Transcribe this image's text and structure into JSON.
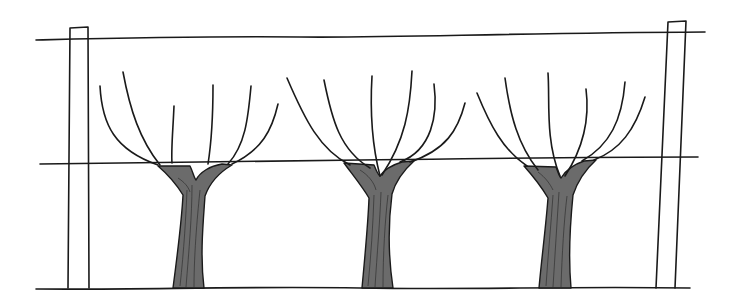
{
  "illustration": {
    "title": "Vines trained on a trellis",
    "colors": {
      "ink": "#1a1a1a",
      "trunk_fill": "#6b6b6b",
      "background": "#ffffff"
    },
    "wires": [
      {
        "name": "top-wire",
        "d": "M36,40 C120,38 200,36 300,37 S500,33 705,32"
      },
      {
        "name": "middle-wire",
        "d": "M40,164 C150,163 250,161 360,160 S560,157 698,157"
      },
      {
        "name": "ground-line",
        "d": "M36,289 C140,290 240,286 360,288 S560,286 690,288"
      }
    ],
    "posts": [
      {
        "name": "left-post",
        "d": "M68,288 L70,28 L88,27 L89,288"
      },
      {
        "name": "right-post",
        "d": "M656,288 L668,22 L686,21 L675,288"
      }
    ],
    "vines": [
      {
        "name": "vine-left",
        "trunk": "M173,288 C178,250 182,215 183,195 C175,182 165,172 158,166 L190,166 C193,172 194,178 196,180 C200,172 210,166 222,164 L232,165 C220,172 210,182 205,196 C203,225 200,255 204,288 Z",
        "grain": [
          "M180,286 C184,250 186,215 187,190",
          "M186,287 C189,250 192,215 192,185",
          "M194,287 C194,250 198,210 200,190",
          "M178,178 C184,182 188,186 190,192"
        ],
        "canes": [
          "M100,86 C102,125 115,150 158,165",
          "M123,72 C130,110 140,140 160,165",
          "M174,106 C173,130 171,150 172,163",
          "M213,85 C213,120 211,145 208,164",
          "M251,86 C248,120 245,145 228,164",
          "M278,104 C272,130 262,150 232,164"
        ]
      },
      {
        "name": "vine-middle",
        "trunk": "M362,288 C365,255 368,225 369,198 C362,186 352,174 344,163 L374,165 C376,170 378,175 380,176 C384,170 392,165 402,162 L414,161 C404,170 396,180 392,194 C388,225 388,255 393,288 Z",
        "grain": [
          "M368,286 C371,255 373,225 374,195",
          "M375,287 C377,255 380,220 381,192",
          "M383,287 C383,255 385,220 388,195",
          "M360,170 C368,175 374,182 376,190"
        ],
        "canes": [
          "M287,78 C305,120 320,150 350,165",
          "M324,80 C332,120 340,150 370,168",
          "M372,76 C370,110 372,145 380,176",
          "M412,71 C410,110 405,140 382,175",
          "M434,84 C438,115 432,150 400,162",
          "M465,103 C458,130 446,150 410,162"
        ]
      },
      {
        "name": "vine-right",
        "trunk": "M539,288 C542,255 546,225 548,198 C541,186 532,175 524,166 L556,167 C558,172 559,176 561,178 C566,170 575,164 584,161 L596,160 C585,170 578,180 573,195 C570,225 568,255 571,288 Z",
        "grain": [
          "M546,286 C548,255 551,225 553,195",
          "M553,287 C555,255 557,222 559,192",
          "M561,287 C562,255 564,220 567,196",
          "M538,172 C546,178 550,184 553,190"
        ],
        "canes": [
          "M477,93 C490,125 503,150 527,166",
          "M505,78 C510,115 518,145 538,170",
          "M548,73 C550,100 545,140 560,176",
          "M586,89 C590,120 582,150 565,176",
          "M625,82 C622,120 610,145 582,161",
          "M645,97 C635,130 620,150 594,160"
        ]
      }
    ]
  }
}
